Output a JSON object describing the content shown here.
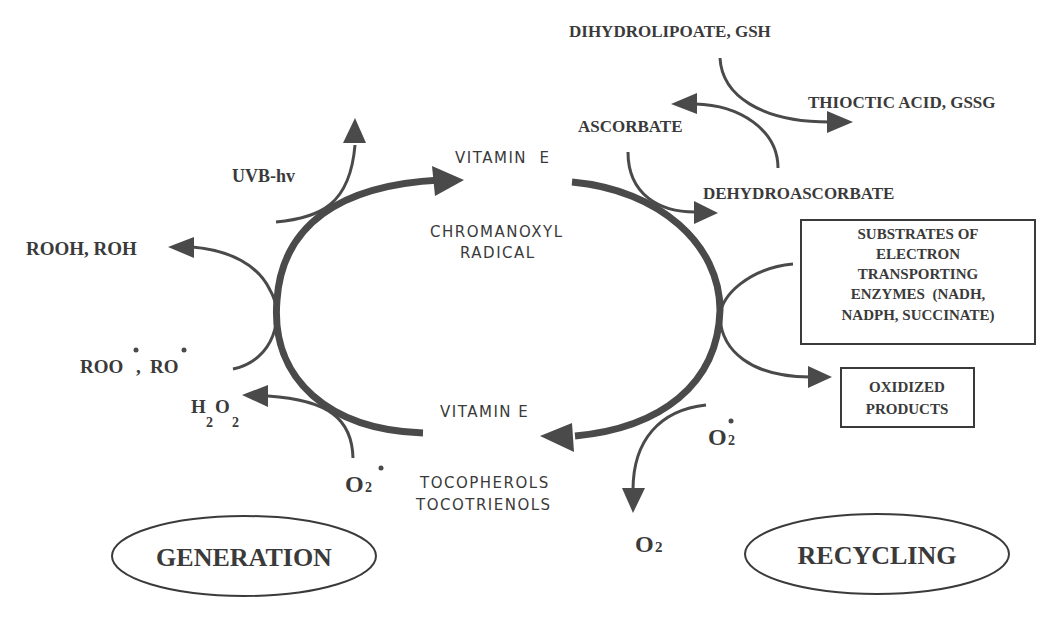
{
  "diagram": {
    "center": {
      "top_label": "VITAMIN  E",
      "top_sub_1": "CHROMANOXYL",
      "top_sub_2": "RADICAL",
      "bottom_label": "VITAMIN E",
      "bottom_sub_1": "TOCOPHEROLS",
      "bottom_sub_2": "TOCOTRIENOLS"
    },
    "generation": {
      "title": "GENERATION",
      "uvb": "UVB-hv",
      "rooh": "ROOH, ROH",
      "roo_radical": "ROO",
      "ro_radical": "RO",
      "h2o2_h": "H",
      "h2o2_sub1": "2",
      "h2o2_o": "O",
      "h2o2_sub2": "2",
      "superoxide": "O",
      "superoxide_sub": "2"
    },
    "recycling": {
      "title": "RECYCLING",
      "dihydrolipoate": "DIHYDROLIPOATE, GSH",
      "thioctic": "THIOCTIC ACID, GSSG",
      "ascorbate": "ASCORBATE",
      "dehydroascorbate": "DEHYDROASCORBATE",
      "substrates_box": [
        "SUBSTRATES OF",
        "ELECTRON",
        "TRANSPORTING",
        "ENZYMES  (NADH,",
        "NADPH, SUCCINATE)"
      ],
      "oxidized_box": [
        "OXIDIZED",
        "PRODUCTS"
      ],
      "superoxide": "O",
      "superoxide_sub": "2",
      "oxygen": "O",
      "oxygen_sub": "2"
    },
    "colors": {
      "ink": "#3a3a3a",
      "background": "#ffffff"
    }
  }
}
